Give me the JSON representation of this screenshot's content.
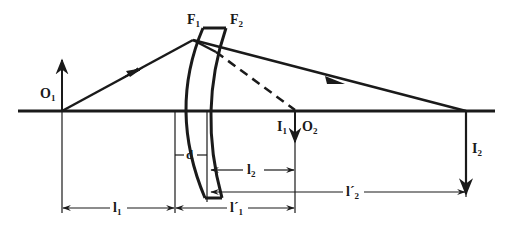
{
  "diagram": {
    "type": "thick-lens-ray-diagram",
    "colors": {
      "ink": "#1a1a1a",
      "background": "#ffffff"
    },
    "labels": {
      "F1": "F",
      "F1_sub": "1",
      "F2": "F",
      "F2_sub": "2",
      "O1": "O",
      "O1_sub": "1",
      "I1": "I",
      "I1_sub": "1",
      "O2": "O",
      "O2_sub": "2",
      "I2": "I",
      "I2_sub": "2",
      "d": "d",
      "l1": "l",
      "l1_sub": "1",
      "l1p": "l´",
      "l1p_sub": "1",
      "l2": "l",
      "l2_sub": "2",
      "l2p": "l´",
      "l2p_sub": "2"
    }
  }
}
